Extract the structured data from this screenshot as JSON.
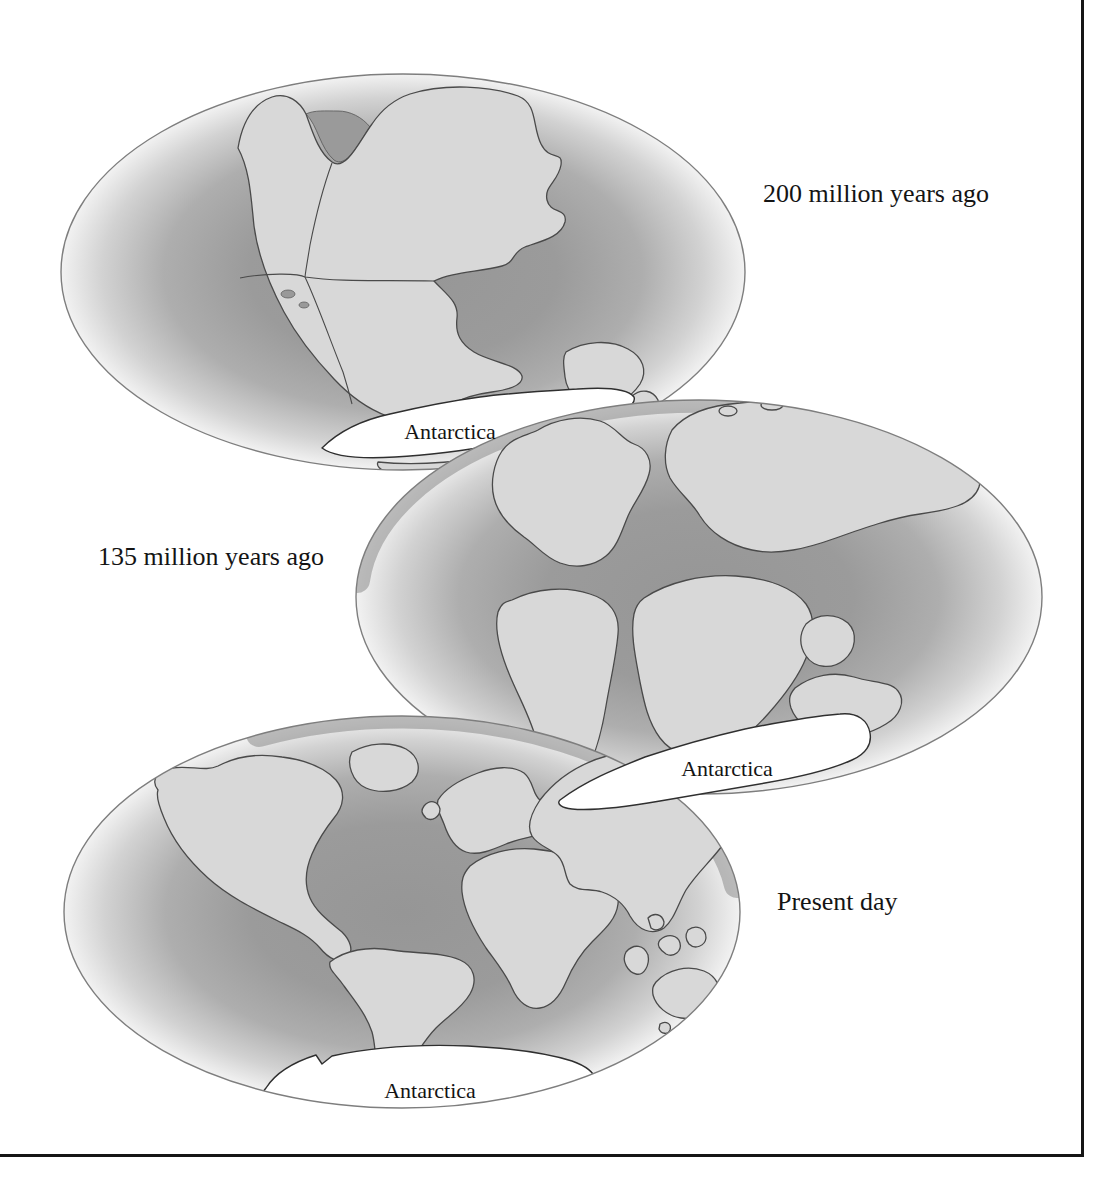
{
  "figure": {
    "description_labels": {
      "globe_200": "200 million years ago",
      "globe_135": "135 million years ago",
      "globe_present": "Present day"
    },
    "globes": [
      {
        "time_label": "200 million years ago",
        "antarctica_label": "Antarctica"
      },
      {
        "time_label": "135 million years ago",
        "antarctica_label": "Antarctica"
      },
      {
        "time_label": "Present day",
        "antarctica_label": "Antarctica"
      }
    ],
    "colors": {
      "background": "#ffffff",
      "ocean_center": "#969696",
      "ocean_rim": "#f2f2f2",
      "land": "#d8d8d8",
      "antarctica": "#ffffff",
      "coast_outline": "#4a4a4a",
      "globe_rim": "#7e7e7e",
      "overlap_shadow": "#8d8d8d",
      "text": "#141414",
      "frame": "#161616"
    }
  }
}
